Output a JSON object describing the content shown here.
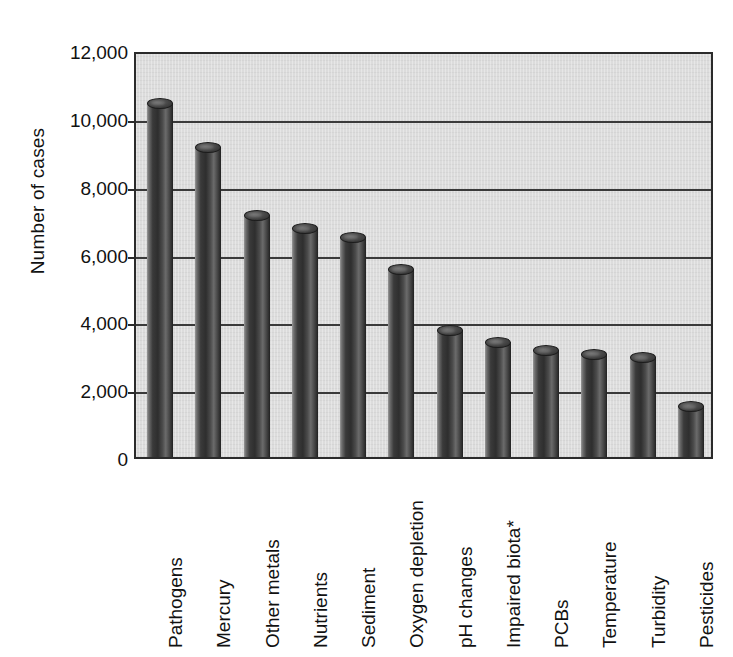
{
  "chart_data": {
    "type": "bar",
    "title": "",
    "subtitle": "",
    "xlabel": "",
    "ylabel": "Number of cases",
    "ylim": [
      0,
      12000
    ],
    "yticks": [
      0,
      2000,
      4000,
      6000,
      8000,
      10000,
      12000
    ],
    "ytick_labels": [
      "0",
      "2,000",
      "4,000",
      "6,000",
      "8,000",
      "10,000",
      "12,000"
    ],
    "grid": "horizontal",
    "legend": "none",
    "orientation": "vertical",
    "bar_style": "3d-cylinder",
    "categories": [
      "Pathogens",
      "Mercury",
      "Other metals",
      "Nutrients",
      "Sediment",
      "Oxygen depletion",
      "pH changes",
      "Impaired biota*",
      "PCBs",
      "Temperature",
      "Turbidity",
      "Pesticides"
    ],
    "values": [
      10450,
      9150,
      7150,
      6750,
      6500,
      5550,
      3750,
      3400,
      3150,
      3050,
      2950,
      1500
    ],
    "annotations": [
      "* Impaired biota"
    ],
    "colors": {
      "plot_background": "#dcdcdc",
      "page_background": "#ffffff",
      "bar_dark": "#2e2e2e",
      "bar_light": "#9a9a9a",
      "axis": "#2b2b2b",
      "gridline": "#3a3a3a",
      "text": "#111111"
    }
  }
}
